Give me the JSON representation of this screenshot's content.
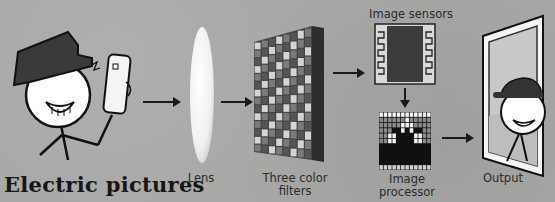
{
  "title": "Electric pictures",
  "stages": [
    {
      "id": "lens",
      "label": "Lens"
    },
    {
      "id": "filters",
      "label": "Three color filters"
    },
    {
      "id": "sensors",
      "label": "Image sensors"
    },
    {
      "id": "processor",
      "label": "Image processor"
    },
    {
      "id": "output",
      "label": "Output"
    }
  ],
  "labels": {
    "lens": "Lens",
    "filters_line1": "Three color",
    "filters_line2": "filters",
    "sensors": "Image sensors",
    "processor": "Image processor",
    "output": "Output"
  },
  "colors": {
    "background": "#a8a8a6",
    "ink": "#1a1a1a",
    "hat": "#3a3a3a",
    "filter_dark": "#4a4a4a",
    "filter_light": "#cfcfcf",
    "sensor_body": "#3c3c3c"
  }
}
